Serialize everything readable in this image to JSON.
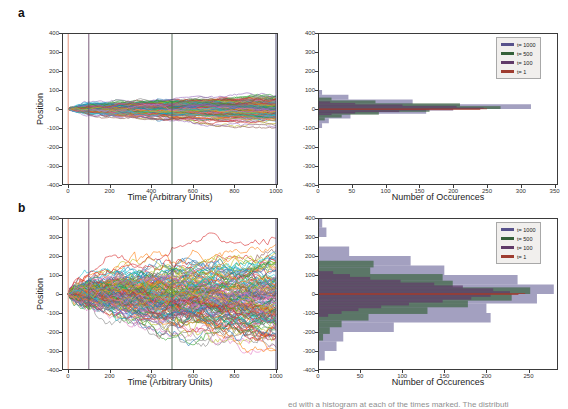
{
  "ui": {
    "panel_a_label": "a",
    "panel_b_label": "b",
    "trajectory_xlabel": "Time (Arbitrary Units)",
    "trajectory_ylabel": "Position",
    "histogram_xlabel": "Number of Occurences",
    "caption_fragment": "ed with a histogram at each of the times marked. The distributi"
  },
  "colors": {
    "frame": "#3b3b3b",
    "trajectory_cycle": [
      "#1f77b4",
      "#ff7f0e",
      "#2ca02c",
      "#d62728",
      "#9467bd",
      "#8c564b",
      "#e377c2",
      "#7f7f7f",
      "#bcbd22",
      "#17becf"
    ]
  },
  "chart_data": [
    {
      "id": "a_trajectories",
      "panel": "a",
      "type": "line",
      "title": "",
      "xlabel": "Time (Arbitrary Units)",
      "ylabel": "Position",
      "xlim": [
        -30,
        1010
      ],
      "ylim": [
        -400,
        400
      ],
      "xticks": [
        0,
        200,
        400,
        600,
        800,
        1000
      ],
      "yticks": [
        400,
        300,
        200,
        100,
        0,
        -100,
        -200,
        -300,
        -400
      ],
      "grid": false,
      "n_walks": 220,
      "final_std": 33,
      "seed": 42,
      "vlines": [
        {
          "t": 1,
          "color": "#e08a70"
        },
        {
          "t": 100,
          "color": "#6d4a6d"
        },
        {
          "t": 500,
          "color": "#48604b"
        },
        {
          "t": 1000,
          "color": "#44406b"
        }
      ],
      "description": "Many random-walk trajectories starting at 0, spreading to about ±100 by t=1000"
    },
    {
      "id": "a_histogram",
      "panel": "a",
      "type": "bar",
      "orientation": "horizontal",
      "xlabel": "Number of Occurences",
      "ylabel": "",
      "xlim": [
        0,
        355
      ],
      "xticks": [
        0,
        50,
        100,
        150,
        200,
        250,
        300,
        350
      ],
      "ylim": [
        -400,
        400
      ],
      "yticks": [
        400,
        300,
        200,
        100,
        0,
        -100,
        -200,
        -300,
        -400
      ],
      "grid": false,
      "legend_position": "upper right",
      "series": [
        {
          "name": "t= 1000",
          "swatch": "#57518b",
          "fill": "rgba(88,82,140,0.55)",
          "bin_width": 25,
          "bars": [
            [
              -100,
              6
            ],
            [
              -75,
              16
            ],
            [
              -50,
              48
            ],
            [
              -25,
              160
            ],
            [
              0,
              315
            ],
            [
              25,
              140
            ],
            [
              50,
              45
            ],
            [
              75,
              6
            ]
          ]
        },
        {
          "name": "t= 500",
          "swatch": "#346038",
          "fill": "rgba(52,96,56,0.65)",
          "bin_width": 15,
          "bars": [
            [
              -60,
              10
            ],
            [
              -45,
              35
            ],
            [
              -30,
              90
            ],
            [
              -15,
              165
            ],
            [
              0,
              270
            ],
            [
              15,
              210
            ],
            [
              30,
              85
            ],
            [
              45,
              20
            ]
          ]
        },
        {
          "name": "t= 100",
          "swatch": "#603a68",
          "fill": "rgba(96,58,104,0.7)",
          "bin_width": 8,
          "bars": [
            [
              -32,
              20
            ],
            [
              -24,
              55
            ],
            [
              -16,
              120
            ],
            [
              -8,
              200
            ],
            [
              0,
              245
            ],
            [
              8,
              205
            ],
            [
              16,
              125
            ],
            [
              24,
              55
            ],
            [
              32,
              18
            ]
          ]
        },
        {
          "name": "t= 1",
          "swatch": "#9e3c30",
          "fill": "rgba(158,60,48,0.85)",
          "bin_width": 3,
          "bars": [
            [
              -3,
              240
            ],
            [
              0,
              250
            ]
          ]
        }
      ]
    },
    {
      "id": "b_trajectories",
      "panel": "b",
      "type": "line",
      "title": "",
      "xlabel": "Time (Arbitrary Units)",
      "ylabel": "Position",
      "xlim": [
        -30,
        1010
      ],
      "ylim": [
        -400,
        400
      ],
      "xticks": [
        0,
        200,
        400,
        600,
        800,
        1000
      ],
      "yticks": [
        400,
        300,
        200,
        100,
        0,
        -100,
        -200,
        -300,
        -400
      ],
      "grid": false,
      "n_walks": 170,
      "final_std": 120,
      "seed": 7,
      "vlines": [
        {
          "t": 1,
          "color": "#e08a70"
        },
        {
          "t": 100,
          "color": "#6d4a6d"
        },
        {
          "t": 500,
          "color": "#48604b"
        },
        {
          "t": 1000,
          "color": "#44406b"
        }
      ],
      "description": "Many random-walk trajectories starting at 0, spreading to about ±350 by t=1000"
    },
    {
      "id": "b_histogram",
      "panel": "b",
      "type": "bar",
      "orientation": "horizontal",
      "xlabel": "Number of Occurences",
      "ylabel": "",
      "xlim": [
        0,
        285
      ],
      "xticks": [
        0,
        50,
        100,
        150,
        200,
        250
      ],
      "ylim": [
        -400,
        400
      ],
      "yticks": [
        400,
        300,
        200,
        100,
        0,
        -100,
        -200,
        -300,
        -400
      ],
      "grid": false,
      "legend_position": "upper right",
      "series": [
        {
          "name": "t= 1000",
          "swatch": "#57518b",
          "fill": "rgba(88,82,140,0.55)",
          "bin_width": 50,
          "bars": [
            [
              -350,
              8
            ],
            [
              -300,
              22
            ],
            [
              -250,
              30
            ],
            [
              -200,
              90
            ],
            [
              -150,
              205
            ],
            [
              -100,
              200
            ],
            [
              -50,
              260
            ],
            [
              0,
              280
            ],
            [
              50,
              237
            ],
            [
              100,
              150
            ],
            [
              150,
              110
            ],
            [
              200,
              37
            ],
            [
              300,
              10
            ],
            [
              350,
              5
            ]
          ]
        },
        {
          "name": "t= 500",
          "swatch": "#346038",
          "fill": "rgba(52,96,56,0.65)",
          "bin_width": 35,
          "bars": [
            [
              -245,
              6
            ],
            [
              -210,
              14
            ],
            [
              -175,
              28
            ],
            [
              -140,
              60
            ],
            [
              -105,
              130
            ],
            [
              -70,
              178
            ],
            [
              -35,
              230
            ],
            [
              0,
              252
            ],
            [
              35,
              160
            ],
            [
              70,
              148
            ],
            [
              105,
              62
            ],
            [
              140,
              66
            ]
          ]
        },
        {
          "name": "t= 100",
          "swatch": "#603a68",
          "fill": "rgba(96,58,104,0.7)",
          "bin_width": 15,
          "bars": [
            [
              -120,
              12
            ],
            [
              -105,
              28
            ],
            [
              -90,
              48
            ],
            [
              -75,
              75
            ],
            [
              -60,
              108
            ],
            [
              -45,
              148
            ],
            [
              -30,
              182
            ],
            [
              -15,
              205
            ],
            [
              0,
              228
            ],
            [
              15,
              208
            ],
            [
              30,
              172
            ],
            [
              45,
              138
            ],
            [
              60,
              98
            ],
            [
              75,
              62
            ],
            [
              90,
              38
            ],
            [
              105,
              18
            ]
          ]
        },
        {
          "name": "t= 1",
          "swatch": "#9e3c30",
          "fill": "rgba(158,60,48,0.85)",
          "bin_width": 5,
          "bars": [
            [
              -5,
              238
            ],
            [
              0,
              246
            ]
          ]
        }
      ]
    }
  ]
}
